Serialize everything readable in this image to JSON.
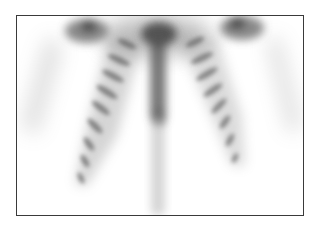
{
  "image": {
    "subject": "bone-scintigraphy-thorax-anterior",
    "frame_color": "#3a3a3a",
    "background_color": "#ffffff",
    "uptake_color": "#4a4a4a",
    "structures": [
      "left-shoulder",
      "right-shoulder",
      "sternum",
      "spine",
      "left-ribs",
      "right-ribs",
      "left-arm",
      "right-arm"
    ]
  }
}
